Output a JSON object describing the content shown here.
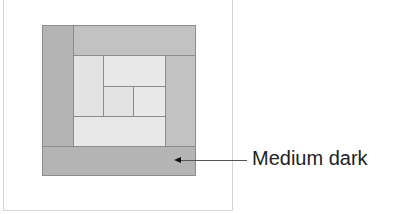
{
  "diagram": {
    "type": "log-cabin-quilt-block",
    "colors": {
      "dark": "#b4b4b4",
      "medium": "#c2c2c2",
      "light": "#e3e3e3",
      "lighter": "#e8e8e8",
      "outline": "#8c8c8c"
    },
    "pieces": [
      {
        "name": "left-strip",
        "x": 0,
        "y": 0,
        "w": 32,
        "h": 122,
        "tone": "dark"
      },
      {
        "name": "top-strip",
        "x": 31,
        "y": 0,
        "w": 123,
        "h": 31,
        "tone": "medium"
      },
      {
        "name": "right-strip",
        "x": 123,
        "y": 30,
        "w": 31,
        "h": 92,
        "tone": "medium"
      },
      {
        "name": "inner-left",
        "x": 31,
        "y": 30,
        "w": 31,
        "h": 62,
        "tone": "light"
      },
      {
        "name": "inner-top",
        "x": 61,
        "y": 30,
        "w": 63,
        "h": 32,
        "tone": "lighter"
      },
      {
        "name": "center-square",
        "x": 61,
        "y": 61,
        "w": 31,
        "h": 31,
        "tone": "light"
      },
      {
        "name": "inner-right-small",
        "x": 91,
        "y": 61,
        "w": 33,
        "h": 31,
        "tone": "lighter"
      },
      {
        "name": "inner-bottom",
        "x": 31,
        "y": 91,
        "w": 93,
        "h": 31,
        "tone": "lighter"
      },
      {
        "name": "bottom-strip",
        "x": 0,
        "y": 121,
        "w": 154,
        "h": 30,
        "tone": "dark"
      }
    ],
    "annotation": {
      "label": "Medium dark",
      "points_to": "bottom-strip"
    }
  }
}
